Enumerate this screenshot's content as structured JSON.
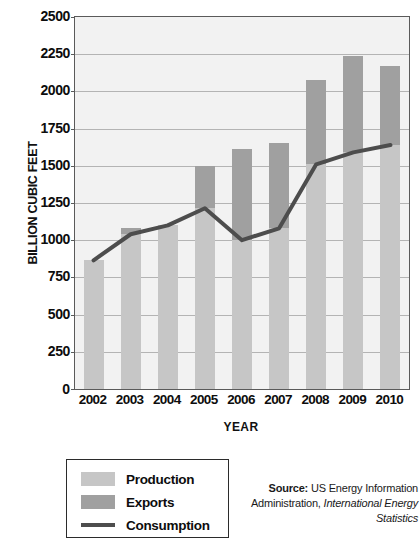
{
  "chart_data": {
    "type": "bar",
    "title": "",
    "subtitle": "",
    "xlabel": "YEAR",
    "ylabel": "BILLION CUBIC FEET",
    "categories": [
      "2002",
      "2003",
      "2004",
      "2005",
      "2006",
      "2007",
      "2008",
      "2009",
      "2010"
    ],
    "ylim": [
      0,
      2500
    ],
    "ytick_values": [
      0,
      250,
      500,
      750,
      1000,
      1250,
      1500,
      1750,
      2000,
      2250,
      2500
    ],
    "ytick_labels": [
      "0",
      "250",
      "500",
      "750",
      "1000",
      "1250",
      "1500",
      "1750",
      "2000",
      "2250",
      "2500"
    ],
    "grid": true,
    "legend_position": "below-left",
    "series": [
      {
        "name": "Production",
        "kind": "bar",
        "color": "#c6c6c6",
        "values": [
          870,
          1080,
          1105,
          1500,
          1610,
          1655,
          2080,
          2240,
          2170
        ]
      },
      {
        "name": "Exports",
        "kind": "bar-overlay",
        "color": "#a0a0a0",
        "values": [
          5,
          40,
          5,
          285,
          610,
          575,
          570,
          650,
          530
        ]
      },
      {
        "name": "Consumption",
        "kind": "line",
        "color": "#4d4d4d",
        "values": [
          865,
          1040,
          1100,
          1215,
          1000,
          1080,
          1510,
          1590,
          1640
        ]
      }
    ]
  },
  "legend": {
    "items": [
      {
        "label": "Production",
        "swatch": "light-gray-swatch",
        "type": "box"
      },
      {
        "label": "Exports",
        "swatch": "dark-gray-swatch",
        "type": "box"
      },
      {
        "label": "Consumption",
        "swatch": "dark-line-swatch",
        "type": "line"
      }
    ]
  },
  "source": {
    "prefix": "Source:",
    "body": " US Energy Information Administration, ",
    "italic": "International Energy Statistics"
  },
  "colors": {
    "production": "#c6c6c6",
    "exports": "#a0a0a0",
    "consumption": "#4d4d4d",
    "plot_background": "#f2f2f2",
    "gridline": "#b4b4b4",
    "frame": "#5a5a5a"
  }
}
